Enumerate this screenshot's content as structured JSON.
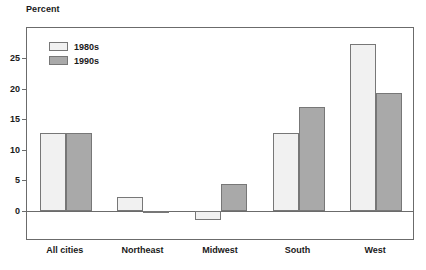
{
  "chart_data": {
    "type": "bar",
    "title": "",
    "xlabel": "",
    "ylabel": "Percent",
    "ylim": [
      -5,
      30
    ],
    "yticks": [
      0,
      5,
      10,
      15,
      20,
      25
    ],
    "ytick_labels": [
      "0",
      "5",
      "10",
      "15",
      "20",
      "25"
    ],
    "grid": false,
    "legend_position": "top-left",
    "categories": [
      "All cities",
      "Northeast",
      "Midwest",
      "South",
      "West"
    ],
    "series": [
      {
        "name": "1980s",
        "color": "#f1f1f1",
        "values": [
          12.8,
          2.3,
          -1.5,
          12.8,
          27.3
        ]
      },
      {
        "name": "1990s",
        "color": "#a9a9a9",
        "values": [
          12.8,
          -0.2,
          4.3,
          17.0,
          19.3
        ]
      }
    ]
  },
  "axis": {
    "y_title": "Percent"
  },
  "legend": {
    "items": [
      {
        "label": "1980s"
      },
      {
        "label": "1990s"
      }
    ]
  },
  "colors": {
    "series_1980s": "#f1f1f1",
    "series_1990s": "#a9a9a9",
    "frame": "#6b6b6b",
    "bar_border": "#777777",
    "text": "#1a1a1a",
    "background": "#ffffff"
  }
}
